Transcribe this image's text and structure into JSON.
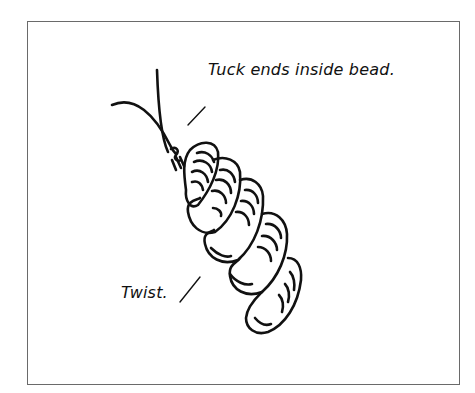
{
  "figure": {
    "type": "instructional-illustration",
    "labels": {
      "tuck": "Tuck ends inside bead.",
      "twist": "Twist."
    },
    "colors": {
      "line": "#111111",
      "frame": "#6a6a6a",
      "background": "#ffffff"
    }
  }
}
